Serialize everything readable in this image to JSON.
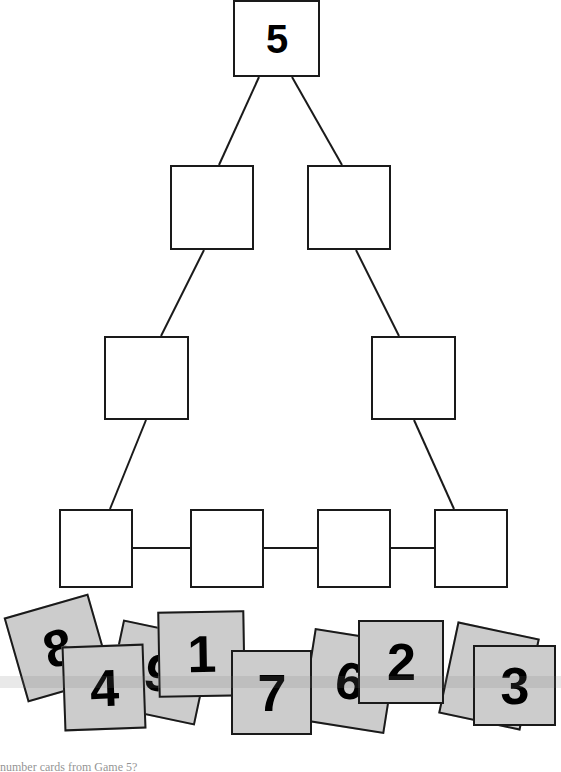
{
  "page": {
    "width": 561,
    "height": 772,
    "background": "#ffffff",
    "line_color": "#1a1a1a",
    "card_fill": "#cccccc",
    "digit_color": "#000000"
  },
  "diagram": {
    "type": "pyramid-tree-worksheet",
    "rows": [
      {
        "row_index": 1,
        "boxes": [
          {
            "label": "5",
            "filled": true,
            "x": 233,
            "y": 0,
            "w": 87,
            "h": 77
          }
        ]
      },
      {
        "row_index": 2,
        "boxes": [
          {
            "label": "",
            "filled": false,
            "x": 170,
            "y": 165,
            "w": 84,
            "h": 85
          },
          {
            "label": "",
            "filled": false,
            "x": 307,
            "y": 165,
            "w": 84,
            "h": 85
          }
        ]
      },
      {
        "row_index": 3,
        "boxes": [
          {
            "label": "",
            "filled": false,
            "x": 104,
            "y": 336,
            "w": 85,
            "h": 84
          },
          {
            "label": "",
            "filled": false,
            "x": 371,
            "y": 336,
            "w": 85,
            "h": 84
          }
        ]
      },
      {
        "row_index": 4,
        "boxes": [
          {
            "label": "",
            "filled": false,
            "x": 59,
            "y": 509,
            "w": 74,
            "h": 79
          },
          {
            "label": "",
            "filled": false,
            "x": 190,
            "y": 509,
            "w": 74,
            "h": 79
          },
          {
            "label": "",
            "filled": false,
            "x": 317,
            "y": 509,
            "w": 74,
            "h": 79
          },
          {
            "label": "",
            "filled": false,
            "x": 434,
            "y": 509,
            "w": 74,
            "h": 79
          }
        ]
      }
    ],
    "connectors": [
      {
        "from": "r1c1",
        "to": "r2c1",
        "x1": 259,
        "y1": 77,
        "x2": 219,
        "y2": 165
      },
      {
        "from": "r1c1",
        "to": "r2c2",
        "x1": 292,
        "y1": 77,
        "x2": 342,
        "y2": 165
      },
      {
        "from": "r2c1",
        "to": "r3c1",
        "x1": 204,
        "y1": 250,
        "x2": 161,
        "y2": 336
      },
      {
        "from": "r2c2",
        "to": "r3c2",
        "x1": 356,
        "y1": 250,
        "x2": 399,
        "y2": 336
      },
      {
        "from": "r3c1",
        "to": "r4c1",
        "x1": 146,
        "y1": 420,
        "x2": 110,
        "y2": 509
      },
      {
        "from": "r3c2",
        "to": "r4c4",
        "x1": 414,
        "y1": 420,
        "x2": 454,
        "y2": 509
      },
      {
        "from": "r4c1",
        "to": "r4c2",
        "x1": 133,
        "y1": 548,
        "x2": 190,
        "y2": 548
      },
      {
        "from": "r4c2",
        "to": "r4c3",
        "x1": 264,
        "y1": 548,
        "x2": 317,
        "y2": 548
      },
      {
        "from": "r4c3",
        "to": "r4c4",
        "x1": 391,
        "y1": 548,
        "x2": 434,
        "y2": 548
      }
    ]
  },
  "number_cards": [
    {
      "label": "8",
      "x": 14,
      "y": 604,
      "w": 88,
      "h": 88,
      "rotation": -16,
      "z": 10
    },
    {
      "label": "4",
      "x": 63,
      "y": 645,
      "w": 82,
      "h": 85,
      "rotation": -2,
      "z": 20
    },
    {
      "label": "9",
      "x": 113,
      "y": 628,
      "w": 92,
      "h": 89,
      "rotation": 12,
      "z": 12
    },
    {
      "label": "1",
      "x": 158,
      "y": 611,
      "w": 87,
      "h": 86,
      "rotation": -1,
      "z": 24
    },
    {
      "label": "7",
      "x": 231,
      "y": 650,
      "w": 81,
      "h": 85,
      "rotation": 0,
      "z": 26
    },
    {
      "label": "6",
      "x": 307,
      "y": 634,
      "w": 85,
      "h": 94,
      "rotation": 9,
      "z": 14
    },
    {
      "label": "2",
      "x": 358,
      "y": 620,
      "w": 86,
      "h": 84,
      "rotation": 0,
      "z": 28
    },
    {
      "label": "5",
      "x": 447,
      "y": 629,
      "w": 84,
      "h": 94,
      "rotation": 12,
      "z": 16
    },
    {
      "label": "3",
      "x": 473,
      "y": 645,
      "w": 83,
      "h": 81,
      "rotation": 0,
      "z": 30
    }
  ],
  "caption": {
    "text": "number cards from Game 5?"
  }
}
